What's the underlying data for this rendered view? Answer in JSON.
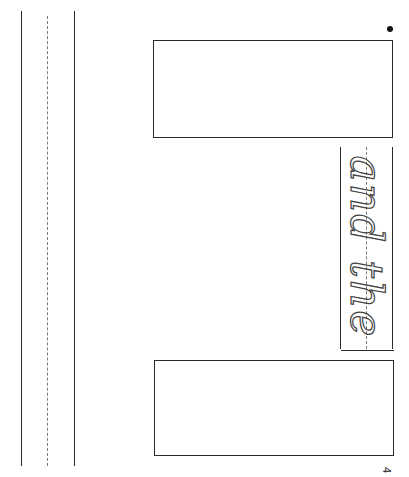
{
  "worksheet": {
    "orientation": "rotated-90",
    "practice_text": "and the",
    "page_number": "4",
    "colors": {
      "line": "#2a2a2a",
      "guide_dashed": "#7a7a7a",
      "background": "#ffffff"
    },
    "left_writing_lines": {
      "solid_lines": 2,
      "dashed_midline": 1
    },
    "boxes": [
      {
        "name": "top-answer-box"
      },
      {
        "name": "bottom-answer-box"
      }
    ]
  }
}
